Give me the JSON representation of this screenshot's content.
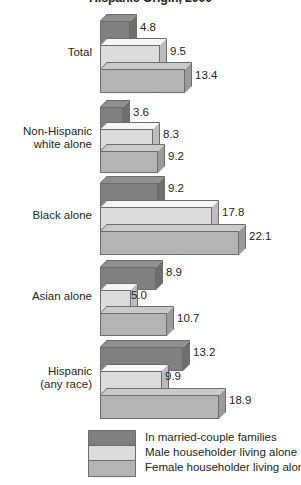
{
  "chart_data": {
    "type": "bar",
    "orientation": "horizontal",
    "title": "Hispanic Origin, 2000",
    "xlabel": "",
    "ylabel": "",
    "categories": [
      "Total",
      "Non-Hispanic white alone",
      "Black alone",
      "Asian alone",
      "Hispanic (any race)"
    ],
    "series": [
      {
        "name": "In married-couple families",
        "color": "#808080",
        "values": [
          4.8,
          3.6,
          9.2,
          8.9,
          13.2
        ]
      },
      {
        "name": "Male householder living alone",
        "color": "#dcdcdc",
        "values": [
          9.5,
          8.3,
          17.8,
          5.0,
          9.9
        ]
      },
      {
        "name": "Female householder living alone",
        "color": "#b4b4b4",
        "values": [
          13.4,
          9.2,
          22.1,
          10.7,
          18.9
        ]
      }
    ],
    "xlim": [
      0,
      22.1
    ],
    "grid": false,
    "legend_position": "bottom"
  },
  "categories": [
    {
      "label_lines": [
        "Total"
      ]
    },
    {
      "label_lines": [
        "Non-Hispanic",
        "white alone"
      ]
    },
    {
      "label_lines": [
        "Black alone"
      ]
    },
    {
      "label_lines": [
        "Asian alone"
      ]
    },
    {
      "label_lines": [
        "Hispanic",
        "(any race)"
      ]
    }
  ],
  "labels": {
    "total_l1": "Total",
    "nhw_l1": "Non-Hispanic",
    "nhw_l2": "white alone",
    "black_l1": "Black alone",
    "asian_l1": "Asian alone",
    "hisp_l1": "Hispanic",
    "hisp_l2": "(any race)"
  },
  "values": {
    "g0": {
      "s0": "4.8",
      "s1": "9.5",
      "s2": "13.4"
    },
    "g1": {
      "s0": "3.6",
      "s1": "8.3",
      "s2": "9.2"
    },
    "g2": {
      "s0": "9.2",
      "s1": "17.8",
      "s2": "22.1"
    },
    "g3": {
      "s0": "8.9",
      "s1": "5.0",
      "s2": "10.7"
    },
    "g4": {
      "s0": "13.2",
      "s1": "9.9",
      "s2": "18.9"
    }
  },
  "legend": {
    "items": [
      {
        "label": "In married-couple families",
        "color": "#808080"
      },
      {
        "label": "Male householder living alone",
        "color": "#dcdcdc"
      },
      {
        "label": "Female householder living alone",
        "color": "#b4b4b4"
      }
    ]
  }
}
